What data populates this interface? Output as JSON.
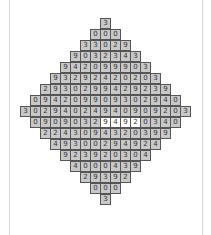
{
  "puzzle": {
    "rows": [
      [
        "3"
      ],
      [
        "0",
        "0",
        "0"
      ],
      [
        "3",
        "3",
        "0",
        "2",
        "9"
      ],
      [
        "9",
        "0",
        "3",
        "2",
        "3",
        "4",
        "3"
      ],
      [
        "9",
        "4",
        "2",
        "0",
        "9",
        "9",
        "9",
        "0",
        "3"
      ],
      [
        "9",
        "3",
        "2",
        "9",
        "2",
        "4",
        "2",
        "0",
        "2",
        "0",
        "3"
      ],
      [
        "2",
        "9",
        "3",
        "0",
        "2",
        "9",
        "9",
        "4",
        "2",
        "9",
        "2",
        "3",
        "9"
      ],
      [
        "0",
        "9",
        "4",
        "2",
        "0",
        "9",
        "9",
        "0",
        "9",
        "3",
        "0",
        "2",
        "9",
        "4",
        "0"
      ],
      [
        "3",
        "0",
        "2",
        "9",
        "4",
        "0",
        "2",
        "4",
        "9",
        "4",
        "0",
        "9",
        "0",
        "9",
        "2",
        "0",
        "3"
      ],
      [
        "0",
        "9",
        "0",
        "9",
        "0",
        "3",
        "2",
        "9",
        "4",
        "9",
        "2",
        "0",
        "3",
        "4",
        "0"
      ],
      [
        "2",
        "2",
        "4",
        "3",
        "0",
        "9",
        "4",
        "3",
        "2",
        "0",
        "3",
        "9",
        "9"
      ],
      [
        "4",
        "9",
        "3",
        "0",
        "0",
        "2",
        "9",
        "4",
        "9",
        "2",
        "4"
      ],
      [
        "9",
        "2",
        "3",
        "9",
        "2",
        "0",
        "3",
        "0",
        "4"
      ],
      [
        "4",
        "0",
        "0",
        "0",
        "4",
        "3",
        "9"
      ],
      [
        "2",
        "9",
        "3",
        "9",
        "2"
      ],
      [
        "0",
        "0",
        "0"
      ],
      [
        "3"
      ]
    ],
    "highlighted": {
      "row": 9,
      "cols": [
        7,
        8,
        9,
        10
      ]
    },
    "colors": {
      "cell": "#c8c8c8",
      "highlight": "#ffffff",
      "border": "#555555"
    }
  }
}
